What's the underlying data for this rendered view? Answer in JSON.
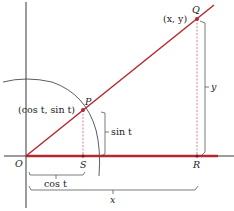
{
  "diagram": {
    "type": "geometry",
    "colors": {
      "ray": "#b5282e",
      "axis": "#222222",
      "circle": "#333333",
      "bracket": "#444444",
      "dashed": "#c05050"
    },
    "points": {
      "O": {
        "label": "O"
      },
      "P": {
        "label": "P",
        "coords": "(cos t, sin t)"
      },
      "Q": {
        "label": "Q",
        "coords": "(x, y)"
      },
      "S": {
        "label": "S"
      },
      "R": {
        "label": "R"
      }
    },
    "measures": {
      "sin_t": "sin t",
      "cos_t": "cos t",
      "x": "x",
      "y": "y"
    }
  }
}
